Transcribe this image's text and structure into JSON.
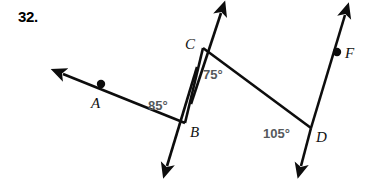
{
  "problem": {
    "number": "32."
  },
  "diagram": {
    "type": "geometry-transversal",
    "stroke_color": "#0d0d0d",
    "angle_label_color": "#55595c",
    "point_label_color": "#111111",
    "points": [
      {
        "id": "A",
        "label": "A",
        "dot": true,
        "x": 101,
        "y": 84,
        "label_x": 91,
        "label_y": 95
      },
      {
        "id": "B",
        "label": "B",
        "dot": false,
        "x": 185,
        "y": 123,
        "label_x": 190,
        "label_y": 124
      },
      {
        "id": "C",
        "label": "C",
        "dot": false,
        "x": 203,
        "y": 48,
        "label_x": 185,
        "label_y": 36
      },
      {
        "id": "D",
        "label": "D",
        "dot": false,
        "x": 311,
        "y": 128,
        "label_x": 316,
        "label_y": 129
      },
      {
        "id": "F",
        "label": "F",
        "dot": true,
        "x": 337,
        "y": 52,
        "label_x": 345,
        "label_y": 45
      }
    ],
    "segments": [
      {
        "id": "BC",
        "from": "B",
        "to": "C"
      },
      {
        "id": "CD",
        "from": "C",
        "to": "D"
      }
    ],
    "rays": [
      {
        "id": "B-to-A-arrow",
        "from_x": 185,
        "from_y": 123,
        "to_x": 58,
        "to_y": 72,
        "arrow": true
      },
      {
        "id": "C-up-arrow",
        "from_x": 185,
        "from_y": 123,
        "to_x": 222,
        "to_y": 8,
        "arrow": true
      },
      {
        "id": "B-down-arrow",
        "from_x": 203,
        "from_y": 48,
        "to_x": 163,
        "to_y": 172,
        "arrow": true
      },
      {
        "id": "F-up-arrow",
        "from_x": 298,
        "from_y": 173,
        "to_x": 347,
        "to_y": 9,
        "arrow": true
      },
      {
        "id": "D-down-arrow",
        "from_x": 347,
        "from_y": 9,
        "to_x": 298,
        "to_y": 173,
        "arrow": true
      }
    ],
    "angles": [
      {
        "id": "angle-ABC",
        "vertex": "B",
        "value": "85°",
        "label_x": 148,
        "label_y": 98
      },
      {
        "id": "angle-BCD",
        "vertex": "C",
        "value": "75°",
        "label_x": 203,
        "label_y": 67
      },
      {
        "id": "angle-CDF",
        "vertex": "D",
        "value": "105°",
        "label_x": 263,
        "label_y": 126
      }
    ]
  }
}
